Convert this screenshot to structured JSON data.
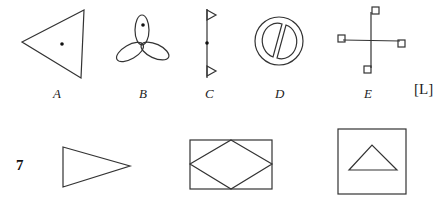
{
  "question": {
    "number": "7",
    "reference": "[L]"
  },
  "options": [
    {
      "label": "A",
      "description": "triangle with interior dot"
    },
    {
      "label": "B",
      "description": "three-petal propeller with dot in top petal"
    },
    {
      "label": "C",
      "description": "vertical line with center dot and two triangular flags"
    },
    {
      "label": "D",
      "description": "circle containing two half-ellipses separated by diagonal gap"
    },
    {
      "label": "E",
      "description": "cross with small squares at each arm end"
    }
  ],
  "figures": [
    {
      "name": "right-pointing triangle"
    },
    {
      "name": "rectangle with inscribed diamond"
    },
    {
      "name": "square with inner triangle"
    }
  ],
  "colors": {
    "stroke": "#333333",
    "background": "#ffffff"
  }
}
